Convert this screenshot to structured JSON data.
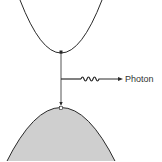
{
  "diagram": {
    "title": "",
    "labels": {
      "photon": "Photon"
    },
    "colors": {
      "line": "#2a2a2a",
      "valence_fill": "#cfcfcf",
      "background": "#ffffff"
    },
    "elements": {
      "conduction_band": "upper parabola (electron)",
      "valence_band": "lower shaded parabola (hole)",
      "transition": "vertical downward arrow from conduction band minimum to valence band maximum",
      "photon_emission": "wavy arrow pointing right"
    }
  }
}
